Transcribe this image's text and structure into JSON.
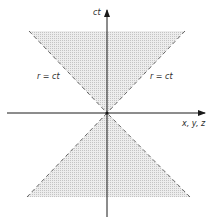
{
  "diagram": {
    "axes": {
      "vertical_label": "ct",
      "horizontal_label": "x, y, z"
    },
    "cone_labels": {
      "left": "r = ct",
      "right": "r = ct"
    },
    "colors": {
      "axis": "#1a1a1a",
      "cone_edge": "#555555",
      "cone_fill": "#d9d9d9",
      "background": "#ffffff"
    }
  }
}
